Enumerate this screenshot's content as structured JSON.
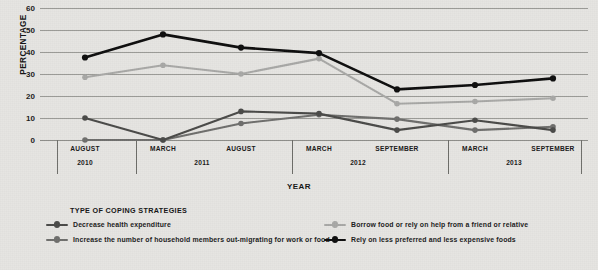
{
  "chart_data": {
    "type": "line",
    "title": "",
    "xlabel": "YEAR",
    "ylabel": "PERCENTAGE",
    "ylim": [
      0,
      60
    ],
    "ytick_step": 10,
    "yticks": [
      0,
      10,
      20,
      30,
      40,
      50,
      60
    ],
    "grid": true,
    "legend_position": "bottom",
    "legend_title": "TYPE OF COPING STRATEGIES",
    "categories": [
      "AUGUST 2010",
      "MARCH 2011",
      "AUGUST 2011",
      "MARCH 2012",
      "SEPTEMBER 2012",
      "MARCH 2013",
      "SEPTEMBER 2013"
    ],
    "x_months": [
      "AUGUST",
      "MARCH",
      "AUGUST",
      "MARCH",
      "SEPTEMBER",
      "MARCH",
      "SEPTEMBER"
    ],
    "x_year_groups": [
      {
        "year": "2010",
        "span": 1
      },
      {
        "year": "2011",
        "span": 2
      },
      {
        "year": "2012",
        "span": 2
      },
      {
        "year": "2013",
        "span": 2
      }
    ],
    "series": [
      {
        "name": "Rely on less preferred and less expensive foods",
        "color": "#0d0d0d",
        "values": [
          37.5,
          48,
          42,
          39.5,
          23,
          25,
          28
        ]
      },
      {
        "name": "Borrow food or rely on help from a friend or relative",
        "color": "#a8a8a6",
        "values": [
          28.5,
          34,
          30,
          37,
          16.5,
          17.5,
          19
        ]
      },
      {
        "name": "Increase the number of household members out-migrating for work or food",
        "color": "#6e6e6c",
        "values": [
          0,
          0,
          7.5,
          11.5,
          9.5,
          4.5,
          6
        ]
      },
      {
        "name": "Decrease health expenditure",
        "color": "#4a4a48",
        "values": [
          10,
          0,
          13,
          12,
          4.5,
          9,
          4.5
        ]
      }
    ]
  },
  "axes": {
    "y_title": "PERCENTAGE",
    "x_title": "YEAR"
  },
  "legend": {
    "title": "TYPE OF COPING STRATEGIES",
    "items": [
      {
        "label": "Decrease health expenditure",
        "color": "#4a4a48"
      },
      {
        "label": "Increase the number of household members out-migrating for work or food",
        "color": "#6e6e6c"
      },
      {
        "label": "Borrow food or rely on help from a friend or relative",
        "color": "#a8a8a6"
      },
      {
        "label": "Rely on less preferred and less expensive foods",
        "color": "#0d0d0d"
      }
    ]
  },
  "colors": {
    "background": "#e6e5e2",
    "gridline": "#9a9a96",
    "axis": "#8a8a86",
    "text": "#141414"
  }
}
